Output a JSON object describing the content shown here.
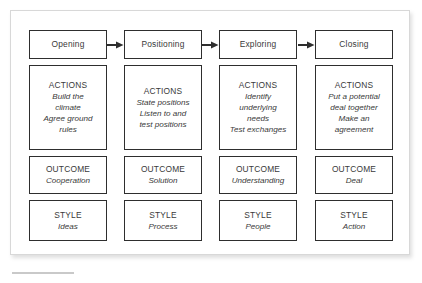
{
  "figure": {
    "type": "process-flow-diagram",
    "row_labels": [
      "ACTIONS",
      "OUTCOME",
      "STYLE"
    ],
    "arrow_icon": "right-arrow-icon",
    "columns": [
      {
        "phase": "Opening",
        "actions_label": "ACTIONS",
        "actions_lines": [
          "Build the",
          "climate",
          "Agree ground",
          "rules"
        ],
        "outcome_label": "OUTCOME",
        "outcome_value": "Cooperation",
        "style_label": "STYLE",
        "style_value": "Ideas"
      },
      {
        "phase": "Positioning",
        "actions_label": "ACTIONS",
        "actions_lines": [
          "State positions",
          "Listen to and",
          "test positions"
        ],
        "outcome_label": "OUTCOME",
        "outcome_value": "Solution",
        "style_label": "STYLE",
        "style_value": "Process"
      },
      {
        "phase": "Exploring",
        "actions_label": "ACTIONS",
        "actions_lines": [
          "Identify",
          "underlying",
          "needs",
          "Test exchanges"
        ],
        "outcome_label": "OUTCOME",
        "outcome_value": "Understanding",
        "style_label": "STYLE",
        "style_value": "People"
      },
      {
        "phase": "Closing",
        "actions_label": "ACTIONS",
        "actions_lines": [
          "Put a potential",
          "deal together",
          "Make an",
          "agreement"
        ],
        "outcome_label": "OUTCOME",
        "outcome_value": "Deal",
        "style_label": "STYLE",
        "style_value": "Action"
      }
    ],
    "colors": {
      "box_border": "#2e2e2e",
      "text": "#3a3a3a",
      "frame_border": "#d8d8d8",
      "background": "#ffffff",
      "rule": "#c9c9c9"
    }
  }
}
